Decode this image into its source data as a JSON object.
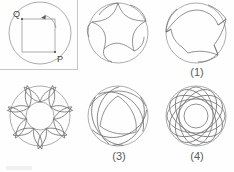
{
  "figure": {
    "title_visible": false,
    "background_color": "#fefefe",
    "stroke_color": "#8a8a8a",
    "label_color": "#3f3f3f",
    "panel_count": 6
  },
  "setup_panel": {
    "name": "construction-diagram",
    "caption": "",
    "point_labels": {
      "q": "Q",
      "p": "P"
    },
    "circle": {
      "cx": 40,
      "cy": 37,
      "r": 32
    },
    "square": {
      "x": 22,
      "y": 22,
      "size": 32
    },
    "arrow": {
      "direction": "right",
      "type": "rotation-arc"
    },
    "frame": {
      "right_border": true,
      "bottom_border": true
    }
  },
  "panels": [
    {
      "id": "1",
      "caption": "(1)",
      "shape": "three-lobed-hypocycloid",
      "lobes": 3,
      "outer_circle": true
    },
    {
      "id": "2",
      "caption": "(2)",
      "shape": "three-spike-rounded-rosette",
      "lobes": 3,
      "outer_circle": true
    },
    {
      "id": "3",
      "caption": "(3)",
      "shape": "seven-petal-rosette-with-inner-circle",
      "lobes": 7,
      "outer_circle": true
    },
    {
      "id": "4",
      "caption": "(4)",
      "shape": "overlapping-arc-triangle",
      "lobes": 3,
      "outer_circle": true
    },
    {
      "id": "5",
      "caption": "(5)",
      "shape": "spirograph-ellipse-rosette",
      "lobes": 6,
      "outer_circle": true
    }
  ]
}
